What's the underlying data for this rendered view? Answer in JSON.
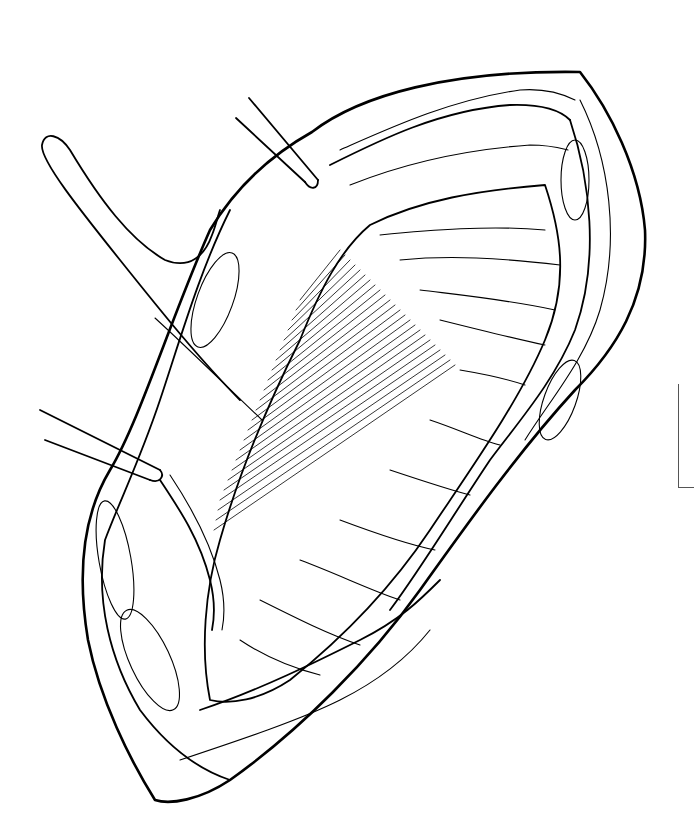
{
  "illustration": {
    "subject": "surgical line drawing of an open incision with retractors",
    "style": "black ink on white",
    "colors": {
      "ink": "#000000",
      "background": "#ffffff",
      "frame_mark": "#555555"
    },
    "elements": [
      "incision-outline",
      "muscle-edge-top",
      "muscle-edge-right",
      "muscle-edge-left",
      "exposed-tissue-hatching",
      "retractor-top",
      "retractor-left",
      "looped-tape-sling",
      "vessel-band",
      "corner-bracket-mark"
    ]
  }
}
